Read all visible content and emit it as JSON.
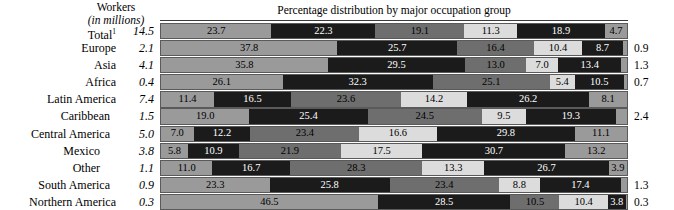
{
  "header": {
    "workers_line1": "Workers",
    "workers_line2": "(in millions)",
    "percentage_title": "Percentage distribution by major occupation group"
  },
  "chart_data": {
    "type": "bar",
    "title": "Percentage distribution by major occupation group",
    "subtitle": "Workers (in millions)",
    "xlabel": "",
    "ylabel": "",
    "xlim": [
      0,
      100
    ],
    "grid": false,
    "legend_position": "none",
    "orientation": "horizontal",
    "stacked": true,
    "categories": [
      "Total ¹",
      "Europe",
      "Asia",
      "Africa",
      "Latin America",
      "Caribbean",
      "Central America",
      "Mexico",
      "Other",
      "South America",
      "Northern America"
    ],
    "workers_millions": [
      "14.5",
      "2.1",
      "4.1",
      "0.4",
      "7.4",
      "1.5",
      "5.0",
      "3.8",
      "1.1",
      "0.9",
      "0.3"
    ],
    "series": [
      {
        "name": "segment-1",
        "tone": "mid",
        "values": [
          23.7,
          37.8,
          35.8,
          26.1,
          11.4,
          19.0,
          7.0,
          5.8,
          11.0,
          23.3,
          46.5
        ]
      },
      {
        "name": "segment-2",
        "tone": "black",
        "values": [
          22.3,
          25.7,
          29.5,
          32.3,
          16.5,
          25.4,
          12.2,
          10.9,
          16.7,
          25.8,
          28.5
        ]
      },
      {
        "name": "segment-3",
        "tone": "dark",
        "values": [
          19.1,
          16.4,
          13.0,
          25.1,
          23.6,
          24.5,
          23.4,
          21.9,
          28.3,
          23.4,
          10.5
        ]
      },
      {
        "name": "segment-4",
        "tone": "light",
        "values": [
          11.3,
          10.4,
          7.0,
          5.4,
          14.2,
          9.5,
          16.6,
          17.5,
          13.3,
          8.8,
          10.4
        ]
      },
      {
        "name": "segment-5",
        "tone": "black",
        "values": [
          18.9,
          8.7,
          13.4,
          10.5,
          26.2,
          19.3,
          29.8,
          30.7,
          26.7,
          17.4,
          3.8
        ]
      },
      {
        "name": "segment-6",
        "tone": "mid",
        "values": [
          4.7,
          0.9,
          1.3,
          0.7,
          8.1,
          2.4,
          11.1,
          13.2,
          3.9,
          1.3,
          0.3
        ]
      }
    ]
  },
  "rows": [
    {
      "label": "Total",
      "footnote": "1",
      "indent": 0,
      "workers": "14.5",
      "trailing": "",
      "segments": [
        {
          "value": "23.7",
          "pct": 23.7,
          "tone": "t-mid",
          "show": true
        },
        {
          "value": "22.3",
          "pct": 22.3,
          "tone": "t-black",
          "show": true
        },
        {
          "value": "19.1",
          "pct": 19.1,
          "tone": "t-dark",
          "show": true
        },
        {
          "value": "11.3",
          "pct": 11.3,
          "tone": "t-light",
          "show": true
        },
        {
          "value": "18.9",
          "pct": 18.9,
          "tone": "t-black",
          "show": true
        },
        {
          "value": "4.7",
          "pct": 4.7,
          "tone": "t-mid",
          "show": true
        }
      ]
    },
    {
      "label": "Europe",
      "footnote": "",
      "indent": 0,
      "workers": "2.1",
      "trailing": "0.9",
      "segments": [
        {
          "value": "37.8",
          "pct": 37.8,
          "tone": "t-mid",
          "show": true
        },
        {
          "value": "25.7",
          "pct": 25.7,
          "tone": "t-black",
          "show": true
        },
        {
          "value": "16.4",
          "pct": 16.4,
          "tone": "t-dark",
          "show": true
        },
        {
          "value": "10.4",
          "pct": 10.4,
          "tone": "t-light",
          "show": true
        },
        {
          "value": "8.7",
          "pct": 8.7,
          "tone": "t-black",
          "show": true
        },
        {
          "value": "0.9",
          "pct": 0.9,
          "tone": "t-mid",
          "show": false
        }
      ]
    },
    {
      "label": "Asia",
      "footnote": "",
      "indent": 0,
      "workers": "4.1",
      "trailing": "1.3",
      "segments": [
        {
          "value": "35.8",
          "pct": 35.8,
          "tone": "t-mid",
          "show": true
        },
        {
          "value": "29.5",
          "pct": 29.5,
          "tone": "t-black",
          "show": true
        },
        {
          "value": "13.0",
          "pct": 13.0,
          "tone": "t-dark",
          "show": true
        },
        {
          "value": "7.0",
          "pct": 7.0,
          "tone": "t-light",
          "show": true
        },
        {
          "value": "13.4",
          "pct": 13.4,
          "tone": "t-black",
          "show": true
        },
        {
          "value": "1.3",
          "pct": 1.3,
          "tone": "t-mid",
          "show": false
        }
      ]
    },
    {
      "label": "Africa",
      "footnote": "",
      "indent": 0,
      "workers": "0.4",
      "trailing": "0.7",
      "segments": [
        {
          "value": "26.1",
          "pct": 26.1,
          "tone": "t-mid",
          "show": true
        },
        {
          "value": "32.3",
          "pct": 32.3,
          "tone": "t-black",
          "show": true
        },
        {
          "value": "25.1",
          "pct": 25.1,
          "tone": "t-dark",
          "show": true
        },
        {
          "value": "5.4",
          "pct": 5.4,
          "tone": "t-light",
          "show": true
        },
        {
          "value": "10.5",
          "pct": 10.5,
          "tone": "t-black",
          "show": true
        },
        {
          "value": "0.7",
          "pct": 0.7,
          "tone": "t-mid",
          "show": false
        }
      ]
    },
    {
      "label": "Latin America",
      "footnote": "",
      "indent": 0,
      "workers": "7.4",
      "trailing": "",
      "segments": [
        {
          "value": "11.4",
          "pct": 11.4,
          "tone": "t-mid",
          "show": true
        },
        {
          "value": "16.5",
          "pct": 16.5,
          "tone": "t-black",
          "show": true
        },
        {
          "value": "23.6",
          "pct": 23.6,
          "tone": "t-dark",
          "show": true
        },
        {
          "value": "14.2",
          "pct": 14.2,
          "tone": "t-light",
          "show": true
        },
        {
          "value": "26.2",
          "pct": 26.2,
          "tone": "t-black",
          "show": true
        },
        {
          "value": "8.1",
          "pct": 8.1,
          "tone": "t-mid",
          "show": true
        }
      ]
    },
    {
      "label": "Caribbean",
      "footnote": "",
      "indent": 1,
      "workers": "1.5",
      "trailing": "2.4",
      "segments": [
        {
          "value": "19.0",
          "pct": 19.0,
          "tone": "t-mid",
          "show": true
        },
        {
          "value": "25.4",
          "pct": 25.4,
          "tone": "t-black",
          "show": true
        },
        {
          "value": "24.5",
          "pct": 24.5,
          "tone": "t-dark",
          "show": true
        },
        {
          "value": "9.5",
          "pct": 9.5,
          "tone": "t-light",
          "show": true
        },
        {
          "value": "19.3",
          "pct": 19.3,
          "tone": "t-black",
          "show": true
        },
        {
          "value": "2.4",
          "pct": 2.4,
          "tone": "t-mid",
          "show": false
        }
      ]
    },
    {
      "label": "Central America",
      "footnote": "",
      "indent": 1,
      "workers": "5.0",
      "trailing": "",
      "segments": [
        {
          "value": "7.0",
          "pct": 7.0,
          "tone": "t-mid",
          "show": true
        },
        {
          "value": "12.2",
          "pct": 12.2,
          "tone": "t-black",
          "show": true
        },
        {
          "value": "23.4",
          "pct": 23.4,
          "tone": "t-dark",
          "show": true
        },
        {
          "value": "16.6",
          "pct": 16.6,
          "tone": "t-light",
          "show": true
        },
        {
          "value": "29.8",
          "pct": 29.8,
          "tone": "t-black",
          "show": true
        },
        {
          "value": "11.1",
          "pct": 11.1,
          "tone": "t-mid",
          "show": true
        }
      ]
    },
    {
      "label": "Mexico",
      "footnote": "",
      "indent": 2,
      "workers": "3.8",
      "trailing": "",
      "segments": [
        {
          "value": "5.8",
          "pct": 5.8,
          "tone": "t-mid",
          "show": true
        },
        {
          "value": "10.9",
          "pct": 10.9,
          "tone": "t-black",
          "show": true
        },
        {
          "value": "21.9",
          "pct": 21.9,
          "tone": "t-dark",
          "show": true
        },
        {
          "value": "17.5",
          "pct": 17.5,
          "tone": "t-light",
          "show": true
        },
        {
          "value": "30.7",
          "pct": 30.7,
          "tone": "t-black",
          "show": true
        },
        {
          "value": "13.2",
          "pct": 13.2,
          "tone": "t-mid",
          "show": true
        }
      ]
    },
    {
      "label": "Other",
      "footnote": "",
      "indent": 2,
      "workers": "1.1",
      "trailing": "",
      "segments": [
        {
          "value": "11.0",
          "pct": 11.0,
          "tone": "t-mid",
          "show": true
        },
        {
          "value": "16.7",
          "pct": 16.7,
          "tone": "t-black",
          "show": true
        },
        {
          "value": "28.3",
          "pct": 28.3,
          "tone": "t-dark",
          "show": true
        },
        {
          "value": "13.3",
          "pct": 13.3,
          "tone": "t-light",
          "show": true
        },
        {
          "value": "26.7",
          "pct": 26.7,
          "tone": "t-black",
          "show": true
        },
        {
          "value": "3.9",
          "pct": 3.9,
          "tone": "t-mid",
          "show": true
        }
      ]
    },
    {
      "label": "South America",
      "footnote": "",
      "indent": 1,
      "workers": "0.9",
      "trailing": "1.3",
      "segments": [
        {
          "value": "23.3",
          "pct": 23.3,
          "tone": "t-mid",
          "show": true
        },
        {
          "value": "25.8",
          "pct": 25.8,
          "tone": "t-black",
          "show": true
        },
        {
          "value": "23.4",
          "pct": 23.4,
          "tone": "t-dark",
          "show": true
        },
        {
          "value": "8.8",
          "pct": 8.8,
          "tone": "t-light",
          "show": true
        },
        {
          "value": "17.4",
          "pct": 17.4,
          "tone": "t-black",
          "show": true
        },
        {
          "value": "1.3",
          "pct": 1.3,
          "tone": "t-mid",
          "show": false
        }
      ]
    },
    {
      "label": "Northern America",
      "footnote": "",
      "indent": 0,
      "workers": "0.3",
      "trailing": "0.3",
      "segments": [
        {
          "value": "46.5",
          "pct": 46.5,
          "tone": "t-mid",
          "show": true
        },
        {
          "value": "28.5",
          "pct": 28.5,
          "tone": "t-black",
          "show": true
        },
        {
          "value": "10.5",
          "pct": 10.5,
          "tone": "t-dark",
          "show": true
        },
        {
          "value": "10.4",
          "pct": 10.4,
          "tone": "t-light",
          "show": true
        },
        {
          "value": "3.8",
          "pct": 3.8,
          "tone": "t-black",
          "show": true
        },
        {
          "value": "0.3",
          "pct": 0.3,
          "tone": "t-mid",
          "show": false
        }
      ]
    }
  ]
}
